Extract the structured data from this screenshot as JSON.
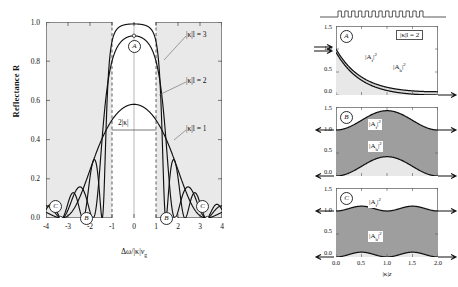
{
  "figure": {
    "type": "scientific-figure"
  },
  "main_plot": {
    "ylabel": "Reflectance R",
    "xlabel_parts": {
      "delta": "Δω/|κ|",
      "vg": "v",
      "vg_sub": "g"
    },
    "yticks": [
      "0.0",
      "0.2",
      "0.4",
      "0.6",
      "0.8",
      "1.0"
    ],
    "ytick_values": [
      0.0,
      0.2,
      0.4,
      0.6,
      0.8,
      1.0
    ],
    "xticks": [
      "-4",
      "-3",
      "-2",
      "-1",
      "0",
      "1",
      "2",
      "3",
      "4"
    ],
    "xtick_values": [
      -4,
      -3,
      -2,
      -1,
      0,
      1,
      2,
      3,
      4
    ],
    "xlim": [
      -4,
      4
    ],
    "ylim": [
      0.0,
      1.0
    ],
    "plot_bg": "#e9e9e9",
    "stopband_bg": "#ffffff",
    "curve_labels": [
      {
        "text": "|κ|l = 3",
        "kl": 3
      },
      {
        "text": "|κ|l = 2",
        "kl": 2
      },
      {
        "text": "|κ|l = 1",
        "kl": 1
      }
    ],
    "bandwidth_annotation": "2|κ|",
    "markers": [
      {
        "label": "A",
        "x": 0.0,
        "y": 0.93
      },
      {
        "label": "B",
        "x": -1.93,
        "y": 0.0
      },
      {
        "label": "B",
        "x": 1.93,
        "y": 0.0
      },
      {
        "label": "C",
        "x": -3.33,
        "y": 0.05
      },
      {
        "label": "C",
        "x": 3.33,
        "y": 0.05
      }
    ],
    "dashed_lines_at": [
      -1,
      1
    ],
    "center_line_at": 0
  },
  "chart_data": [
    {
      "type": "line",
      "title": "Reflectance R",
      "xlabel": "Δω/|κ|v_g",
      "ylabel": "Reflectance R",
      "xlim": [
        -4,
        4
      ],
      "ylim": [
        0,
        1
      ],
      "grid": false,
      "series": [
        {
          "name": "|κ|l = 3",
          "peak": 0.99,
          "x": [
            -4,
            -3.8,
            -3.6,
            -3.4,
            -3.2,
            -3,
            -2.8,
            -2.6,
            -2.4,
            -2.2,
            -2,
            -1.8,
            -1.6,
            -1.4,
            -1.2,
            -1,
            -0.8,
            -0.6,
            -0.4,
            -0.2,
            0,
            0.2,
            0.4,
            0.6,
            0.8,
            1,
            1.2,
            1.4,
            1.6,
            1.8,
            2,
            2.2,
            2.4,
            2.6,
            2.8,
            3,
            3.2,
            3.4,
            3.6,
            3.8,
            4
          ],
          "values": [
            0.04,
            0.0,
            0.05,
            0.09,
            0.05,
            0.0,
            0.06,
            0.13,
            0.13,
            0.05,
            0.0,
            0.08,
            0.21,
            0.31,
            0.26,
            0.93,
            0.985,
            0.988,
            0.988,
            0.988,
            0.988,
            0.988,
            0.988,
            0.988,
            0.985,
            0.93,
            0.26,
            0.31,
            0.21,
            0.08,
            0.0,
            0.05,
            0.13,
            0.13,
            0.06,
            0.0,
            0.05,
            0.09,
            0.05,
            0.0,
            0.04
          ]
        },
        {
          "name": "|κ|l = 2",
          "peak": 0.93,
          "x": [
            -4,
            -3.8,
            -3.6,
            -3.4,
            -3.2,
            -3,
            -2.8,
            -2.6,
            -2.4,
            -2.2,
            -2,
            -1.8,
            -1.6,
            -1.4,
            -1.2,
            -1,
            -0.8,
            -0.6,
            -0.4,
            -0.2,
            0,
            0.2,
            0.4,
            0.6,
            0.8,
            1,
            1.2,
            1.4,
            1.6,
            1.8,
            2,
            2.2,
            2.4,
            2.6,
            2.8,
            3,
            3.2,
            3.4,
            3.6,
            3.8,
            4
          ],
          "values": [
            0.03,
            0.05,
            0.02,
            0.0,
            0.04,
            0.09,
            0.1,
            0.05,
            0.0,
            0.07,
            0.16,
            0.16,
            0.06,
            0.0,
            0.24,
            0.78,
            0.89,
            0.915,
            0.925,
            0.93,
            0.93,
            0.93,
            0.925,
            0.915,
            0.89,
            0.78,
            0.24,
            0.0,
            0.06,
            0.16,
            0.16,
            0.07,
            0.0,
            0.05,
            0.1,
            0.09,
            0.04,
            0.0,
            0.02,
            0.05,
            0.03
          ]
        },
        {
          "name": "|κ|l = 1",
          "peak": 0.58,
          "x": [
            -4,
            -3.8,
            -3.6,
            -3.4,
            -3.2,
            -3,
            -2.8,
            -2.6,
            -2.4,
            -2.2,
            -2,
            -1.8,
            -1.6,
            -1.4,
            -1.2,
            -1,
            -0.8,
            -0.6,
            -0.4,
            -0.2,
            0,
            0.2,
            0.4,
            0.6,
            0.8,
            1,
            1.2,
            1.4,
            1.6,
            1.8,
            2,
            2.2,
            2.4,
            2.6,
            2.8,
            3,
            3.2,
            3.4,
            3.6,
            3.8,
            4
          ],
          "values": [
            0.05,
            0.04,
            0.02,
            0.0,
            0.03,
            0.08,
            0.13,
            0.15,
            0.14,
            0.09,
            0.03,
            0.0,
            0.06,
            0.18,
            0.33,
            0.46,
            0.52,
            0.555,
            0.572,
            0.578,
            0.58,
            0.578,
            0.572,
            0.555,
            0.52,
            0.46,
            0.33,
            0.18,
            0.06,
            0.0,
            0.03,
            0.09,
            0.14,
            0.15,
            0.13,
            0.08,
            0.03,
            0.0,
            0.02,
            0.04,
            0.05
          ]
        }
      ]
    },
    {
      "type": "area",
      "panel": "A",
      "title": "|κ|l = 2 on-resonance field decay",
      "xlabel": "|κ|z",
      "xlim": [
        0,
        2
      ],
      "ylim": [
        0,
        1.5
      ],
      "xticks": [
        "0.0",
        "0.5",
        "1.0",
        "1.5",
        "2.0"
      ],
      "yticks": [
        "0.0",
        "0.5",
        "1.0",
        "1.5"
      ],
      "series": [
        {
          "name": "|A_f|²",
          "x": [
            0,
            0.25,
            0.5,
            0.75,
            1.0,
            1.25,
            1.5,
            1.75,
            2.0
          ],
          "values": [
            1.0,
            0.66,
            0.44,
            0.3,
            0.21,
            0.145,
            0.105,
            0.08,
            0.065
          ]
        },
        {
          "name": "|A_b|²",
          "x": [
            0,
            0.25,
            0.5,
            0.75,
            1.0,
            1.25,
            1.5,
            1.75,
            2.0
          ],
          "values": [
            0.93,
            0.6,
            0.39,
            0.255,
            0.17,
            0.11,
            0.07,
            0.04,
            0.0
          ]
        }
      ]
    },
    {
      "type": "area",
      "panel": "B",
      "title": "Band-edge field distribution",
      "xlabel": "|κ|z",
      "xlim": [
        0,
        2
      ],
      "ylim": [
        0,
        1.5
      ],
      "series": [
        {
          "name": "|A_f|²",
          "x": [
            0,
            0.25,
            0.5,
            0.75,
            1.0,
            1.25,
            1.5,
            1.75,
            2.0
          ],
          "values": [
            1.0,
            1.08,
            1.26,
            1.38,
            1.42,
            1.38,
            1.26,
            1.08,
            1.0
          ]
        },
        {
          "name": "|A_b|²",
          "x": [
            0,
            0.25,
            0.5,
            0.75,
            1.0,
            1.25,
            1.5,
            1.75,
            2.0
          ],
          "values": [
            0.0,
            0.08,
            0.26,
            0.38,
            0.42,
            0.38,
            0.26,
            0.08,
            0.0
          ]
        }
      ]
    },
    {
      "type": "area",
      "panel": "C",
      "title": "Off-resonance oscillatory field",
      "xlabel": "|κ|z",
      "xlim": [
        0,
        2
      ],
      "ylim": [
        0,
        1.5
      ],
      "series": [
        {
          "name": "|A_f|²",
          "x": [
            0,
            0.25,
            0.5,
            0.75,
            1.0,
            1.25,
            1.5,
            1.75,
            2.0
          ],
          "values": [
            1.0,
            1.06,
            1.1,
            1.05,
            1.0,
            1.06,
            1.1,
            1.05,
            1.0
          ]
        },
        {
          "name": "|A_b|²",
          "x": [
            0,
            0.25,
            0.5,
            0.75,
            1.0,
            1.25,
            1.5,
            1.75,
            2.0
          ],
          "values": [
            0.0,
            0.06,
            0.1,
            0.05,
            0.0,
            0.06,
            0.1,
            0.05,
            0.0
          ]
        }
      ]
    }
  ],
  "sub_panels": {
    "xlabel_parts": {
      "k": "|κ|",
      "z": "z"
    },
    "xticks": [
      "0.0",
      "0.5",
      "1.0",
      "1.5",
      "2.0"
    ],
    "yticks": [
      "0.0",
      "0.5",
      "1.0",
      "1.5"
    ],
    "panels": [
      {
        "tag": "A",
        "box_label": "|κ|l = 2",
        "fwd_label": "|A",
        "fwd_sub": "f",
        "fwd_sup": "2",
        "bwd_label": "|A",
        "bwd_sub": "b",
        "bwd_sup": "2"
      },
      {
        "tag": "B"
      },
      {
        "tag": "C"
      }
    ],
    "grating_icon": "square-wave-grating"
  }
}
